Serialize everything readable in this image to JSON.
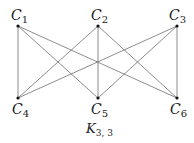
{
  "diagram": {
    "title": "K",
    "title_sub": "3, 3",
    "nodes": [
      {
        "id": "C1",
        "label": "C",
        "sub": "1",
        "x": 18,
        "y": 26
      },
      {
        "id": "C2",
        "label": "C",
        "sub": "2",
        "x": 98,
        "y": 26
      },
      {
        "id": "C3",
        "label": "C",
        "sub": "3",
        "x": 177,
        "y": 26
      },
      {
        "id": "C4",
        "label": "C",
        "sub": "4",
        "x": 18,
        "y": 98
      },
      {
        "id": "C5",
        "label": "C",
        "sub": "5",
        "x": 98,
        "y": 98
      },
      {
        "id": "C6",
        "label": "C",
        "sub": "6",
        "x": 177,
        "y": 98
      }
    ],
    "edges": [
      [
        "C1",
        "C4"
      ],
      [
        "C1",
        "C5"
      ],
      [
        "C1",
        "C6"
      ],
      [
        "C2",
        "C4"
      ],
      [
        "C2",
        "C5"
      ],
      [
        "C2",
        "C6"
      ],
      [
        "C3",
        "C4"
      ],
      [
        "C3",
        "C5"
      ],
      [
        "C3",
        "C6"
      ]
    ],
    "colors": {
      "edge": "#6e6e6e",
      "node": "#111111",
      "text": "#222222"
    }
  }
}
